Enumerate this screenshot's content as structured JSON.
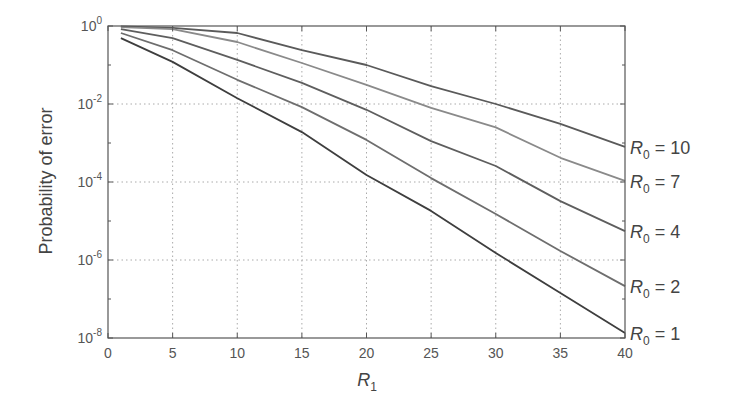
{
  "chart_data": {
    "type": "line",
    "title": "",
    "xlabel": "R1",
    "xlabel_main": "R",
    "xlabel_sub": "1",
    "ylabel": "Probability of error",
    "xlim": [
      0,
      40
    ],
    "ylim": [
      1e-08,
      1
    ],
    "yscale": "log",
    "grid": true,
    "x_ticks": [
      0,
      5,
      10,
      15,
      20,
      25,
      30,
      35,
      40
    ],
    "y_ticks": [
      {
        "base": "10",
        "exp": "0",
        "log": 0
      },
      {
        "base": "10",
        "exp": "-2",
        "log": -2
      },
      {
        "base": "10",
        "exp": "-4",
        "log": -4
      },
      {
        "base": "10",
        "exp": "-6",
        "log": -6
      },
      {
        "base": "10",
        "exp": "-8",
        "log": -8
      }
    ],
    "x": [
      1,
      5,
      10,
      15,
      20,
      25,
      30,
      35,
      40
    ],
    "series": [
      {
        "name": "R0 = 10",
        "label_main": "R",
        "label_sub": "0",
        "label_rest": " = 10",
        "color": "#5a5a5a",
        "log10_values": [
          -0.01,
          -0.05,
          -0.18,
          -0.62,
          -1.0,
          -1.54,
          -2.0,
          -2.51,
          -3.1
        ]
      },
      {
        "name": "R0 = 7",
        "label_main": "R",
        "label_sub": "0",
        "label_rest": " = 7",
        "color": "#8a8a8a",
        "log10_values": [
          -0.03,
          -0.08,
          -0.41,
          -0.95,
          -1.51,
          -2.1,
          -2.6,
          -3.38,
          -3.97
        ]
      },
      {
        "name": "R0 = 4",
        "label_main": "R",
        "label_sub": "0",
        "label_rest": " = 4",
        "color": "#5e5e5e",
        "log10_values": [
          -0.08,
          -0.31,
          -0.87,
          -1.46,
          -2.15,
          -2.95,
          -3.59,
          -4.49,
          -5.26
        ]
      },
      {
        "name": "R0 = 2",
        "label_main": "R",
        "label_sub": "0",
        "label_rest": " = 2",
        "color": "#6e6e6e",
        "log10_values": [
          -0.18,
          -0.62,
          -1.38,
          -2.08,
          -2.92,
          -3.9,
          -4.82,
          -5.77,
          -6.67
        ]
      },
      {
        "name": "R0 = 1",
        "label_main": "R",
        "label_sub": "0",
        "label_rest": " = 1",
        "color": "#3e3e3e",
        "log10_values": [
          -0.31,
          -0.92,
          -1.85,
          -2.72,
          -3.82,
          -4.74,
          -5.82,
          -6.85,
          -7.87
        ]
      }
    ],
    "legend_position": "right, inline labels at line ends"
  }
}
